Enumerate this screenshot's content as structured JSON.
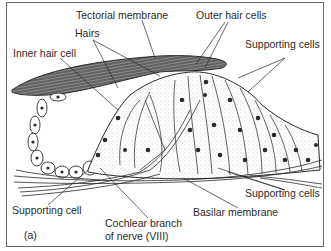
{
  "figure": {
    "panel_label": "(a)",
    "labels": {
      "tectorial_membrane": "Tectorial membrane",
      "outer_hair_cells": "Outer hair cells",
      "hairs": "Hairs",
      "inner_hair_cell": "Inner hair cell",
      "supporting_cells_top": "Supporting cells",
      "supporting_cell_left": "Supporting cell",
      "supporting_cells_bottom": "Supporting cells",
      "basilar_membrane": "Basilar membrane",
      "cochlear_branch_line1": "Cochlear branch",
      "cochlear_branch_line2": "of nerve (VIII)"
    },
    "colors": {
      "ink": "#2a2a2a",
      "frame": "#6a6a6a",
      "background": "#ffffff",
      "stipple": "#d9d9d9"
    }
  }
}
